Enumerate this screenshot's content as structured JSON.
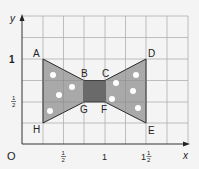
{
  "diagram": {
    "axes": {
      "x_label": "x",
      "y_label": "y",
      "origin_label": "O",
      "x_ticks": [
        {
          "value": 0.5,
          "label_num": "1",
          "label_den": "2",
          "whole": ""
        },
        {
          "value": 1,
          "label": "1"
        },
        {
          "value": 1.5,
          "label_num": "1",
          "label_den": "2",
          "whole": "1"
        }
      ],
      "y_ticks": [
        {
          "value": 1,
          "label": "1"
        },
        {
          "value": 0.5,
          "label_num": "1",
          "label_den": "2"
        }
      ],
      "grid_step": 0.25,
      "x_range": [
        0,
        2
      ],
      "y_range": [
        0,
        1.5
      ]
    },
    "points": [
      {
        "name": "A",
        "x": 0.25,
        "y": 1
      },
      {
        "name": "B",
        "x": 0.75,
        "y": 0.75
      },
      {
        "name": "C",
        "x": 1,
        "y": 0.75
      },
      {
        "name": "D",
        "x": 1.5,
        "y": 1
      },
      {
        "name": "E",
        "x": 1.5,
        "y": 0.25
      },
      {
        "name": "F",
        "x": 1,
        "y": 0.5
      },
      {
        "name": "G",
        "x": 0.75,
        "y": 0.5
      },
      {
        "name": "H",
        "x": 0.25,
        "y": 0.25
      }
    ],
    "shape": "bow tie ABCDEFGH",
    "colors": {
      "background": "#f4f4f4",
      "grid": "#a8a8a8",
      "wing_fill": "#a9a9a9",
      "knot_fill": "#6a6a6a",
      "outline": "#2a2a2a",
      "dots": "#ffffff"
    }
  }
}
